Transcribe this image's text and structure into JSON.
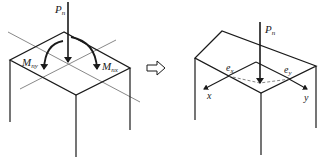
{
  "left_figure": {
    "load_label": "P",
    "load_sub": "n",
    "moment_y_label": "M",
    "moment_y_sub": "ny",
    "moment_x_label": "M",
    "moment_x_sub": "nx"
  },
  "transform_arrow": "equivalent-to-arrow",
  "right_figure": {
    "load_label": "P",
    "load_sub": "n",
    "ecc_x_label": "e",
    "ecc_x_sub": "x",
    "ecc_y_label": "e",
    "ecc_y_sub": "y",
    "axis_x_label": "x",
    "axis_y_label": "y"
  },
  "colors": {
    "line": "#1a1a1a",
    "thin_line": "#555555",
    "dashed": "#666666"
  }
}
